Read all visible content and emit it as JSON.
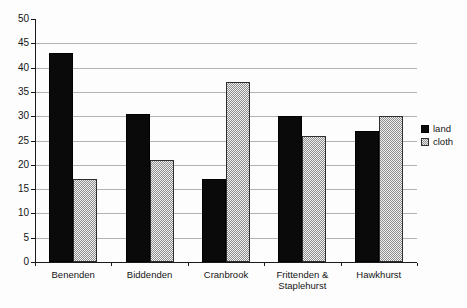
{
  "chart_data": {
    "type": "bar",
    "title": "",
    "categories": [
      "Benenden",
      "Biddenden",
      "Cranbrook",
      "Frittenden & Staplehurst",
      "Hawkhurst"
    ],
    "series": [
      {
        "name": "land",
        "color": "#0a0a0a",
        "pattern": "solid",
        "values": [
          43,
          30.5,
          17,
          30,
          27
        ]
      },
      {
        "name": "cloth",
        "color": "#e0e0e0",
        "pattern": "gray-dot",
        "values": [
          17,
          21,
          37,
          26,
          30
        ]
      }
    ],
    "xlabel": "",
    "ylabel": "",
    "ylim": [
      0,
      50
    ],
    "ytick_step": 5,
    "ytick_labels": [
      "0",
      "5",
      "10",
      "15",
      "20",
      "25",
      "30",
      "35",
      "40",
      "45",
      "50"
    ],
    "grid": "horizontal",
    "gridline_color": "#b3b3b3",
    "legend_position": "right",
    "legend": [
      "land",
      "cloth"
    ]
  }
}
